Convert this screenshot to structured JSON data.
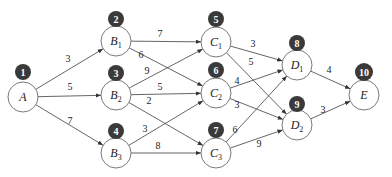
{
  "diagram": {
    "type": "directed weighted network",
    "nodes": [
      {
        "id": "A",
        "name": "A",
        "sub": "",
        "badge": "1",
        "x": 23,
        "y": 97,
        "badge_y": 72
      },
      {
        "id": "B1",
        "name": "B",
        "sub": "1",
        "badge": "2",
        "x": 116,
        "y": 41,
        "badge_y": 19
      },
      {
        "id": "B2",
        "name": "B",
        "sub": "2",
        "badge": "3",
        "x": 116,
        "y": 95,
        "badge_y": 73
      },
      {
        "id": "B3",
        "name": "B",
        "sub": "3",
        "badge": "4",
        "x": 116,
        "y": 153,
        "badge_y": 131
      },
      {
        "id": "C1",
        "name": "C",
        "sub": "1",
        "badge": "5",
        "x": 216,
        "y": 42,
        "badge_y": 19
      },
      {
        "id": "C2",
        "name": "C",
        "sub": "2",
        "badge": "6",
        "x": 216,
        "y": 93,
        "badge_y": 70
      },
      {
        "id": "C3",
        "name": "C",
        "sub": "3",
        "badge": "7",
        "x": 216,
        "y": 153,
        "badge_y": 130
      },
      {
        "id": "D1",
        "name": "D",
        "sub": "1",
        "badge": "8",
        "x": 297,
        "y": 65,
        "badge_y": 43
      },
      {
        "id": "D2",
        "name": "D",
        "sub": "2",
        "badge": "9",
        "x": 297,
        "y": 125,
        "badge_y": 104
      },
      {
        "id": "E",
        "name": "E",
        "sub": "",
        "badge": "10",
        "x": 364,
        "y": 95,
        "badge_y": 72
      }
    ],
    "edges": [
      {
        "from": "A",
        "to": "B1",
        "weight": "3",
        "lx": 68,
        "ly": 62
      },
      {
        "from": "A",
        "to": "B2",
        "weight": "5",
        "lx": 70,
        "ly": 90
      },
      {
        "from": "A",
        "to": "B3",
        "weight": "7",
        "lx": 70,
        "ly": 124
      },
      {
        "from": "B1",
        "to": "C1",
        "weight": "7",
        "lx": 160,
        "ly": 37
      },
      {
        "from": "B1",
        "to": "C2",
        "weight": "6",
        "lx": 141,
        "ly": 58
      },
      {
        "from": "B2",
        "to": "C1",
        "weight": "9",
        "lx": 147,
        "ly": 74
      },
      {
        "from": "B2",
        "to": "C2",
        "weight": "5",
        "lx": 160,
        "ly": 90
      },
      {
        "from": "B2",
        "to": "C3",
        "weight": "2",
        "lx": 149,
        "ly": 104
      },
      {
        "from": "B3",
        "to": "C2",
        "weight": "3",
        "lx": 145,
        "ly": 132
      },
      {
        "from": "B3",
        "to": "C3",
        "weight": "8",
        "lx": 158,
        "ly": 149
      },
      {
        "from": "C1",
        "to": "D1",
        "weight": "3",
        "lx": 253,
        "ly": 47
      },
      {
        "from": "C1",
        "to": "D2",
        "weight": "5",
        "lx": 251,
        "ly": 65
      },
      {
        "from": "C2",
        "to": "D1",
        "weight": "4",
        "lx": 237,
        "ly": 84
      },
      {
        "from": "C2",
        "to": "D2",
        "weight": "3",
        "lx": 237,
        "ly": 108
      },
      {
        "from": "C3",
        "to": "D1",
        "weight": "6",
        "lx": 235,
        "ly": 133
      },
      {
        "from": "C3",
        "to": "D2",
        "weight": "9",
        "lx": 259,
        "ly": 147
      },
      {
        "from": "D1",
        "to": "E",
        "weight": "4",
        "lx": 329,
        "ly": 73
      },
      {
        "from": "D2",
        "to": "E",
        "weight": "3",
        "lx": 323,
        "ly": 113
      }
    ],
    "colors": {
      "badge_fill": "#3a3a3a",
      "badge_text": "#ffffff",
      "node_stroke": "#7a7a7a",
      "edge": "#555555"
    }
  }
}
